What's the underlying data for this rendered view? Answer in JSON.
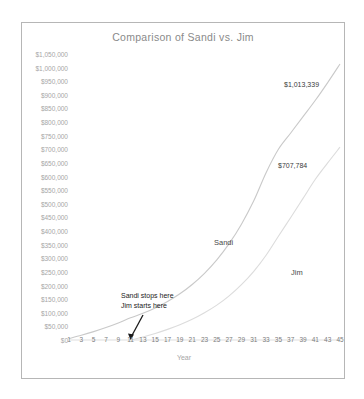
{
  "chart_data": {
    "type": "line",
    "title": "Comparison of Sandi vs. Jim",
    "xlabel": "Year",
    "ylabel": "",
    "grid": false,
    "legend_position": "inline-labels",
    "xlim": [
      1,
      45
    ],
    "ylim": [
      0,
      1050000
    ],
    "x_tick_labels": [
      "1",
      "3",
      "5",
      "7",
      "9",
      "11",
      "13",
      "15",
      "17",
      "19",
      "21",
      "23",
      "25",
      "27",
      "29",
      "31",
      "33",
      "35",
      "37",
      "39",
      "41",
      "43",
      "45"
    ],
    "y_tick_labels": [
      "$1,050,000",
      "$1,000,000",
      "$950,000",
      "$900,000",
      "$850,000",
      "$800,000",
      "$750,000",
      "$700,000",
      "$650,000",
      "$600,000",
      "$550,000",
      "$500,000",
      "$450,000",
      "$400,000",
      "$350,000",
      "$300,000",
      "$250,000",
      "$200,000",
      "$150,000",
      "$100,000",
      "$50,000",
      "$0"
    ],
    "y_tick_values": [
      1050000,
      1000000,
      950000,
      900000,
      850000,
      800000,
      750000,
      700000,
      650000,
      600000,
      550000,
      500000,
      450000,
      400000,
      350000,
      300000,
      250000,
      200000,
      150000,
      100000,
      50000,
      0
    ],
    "series": [
      {
        "name": "Sandi",
        "color": "#c9c9c9",
        "end_label": "$1,013,339",
        "end_value": 1013339,
        "x": [
          1,
          3,
          5,
          7,
          9,
          11,
          13,
          15,
          17,
          19,
          21,
          23,
          25,
          27,
          29,
          31,
          33,
          35,
          37,
          39,
          41,
          43,
          45
        ],
        "values": [
          5350,
          17300,
          30700,
          45700,
          62600,
          81400,
          97800,
          117500,
          141200,
          169700,
          203900,
          245000,
          294400,
          353800,
          425200,
          511000,
          614100,
          700000,
          760000,
          820000,
          880000,
          945000,
          1013339
        ]
      },
      {
        "name": "Jim",
        "color": "#dadada",
        "end_label": "$707,784",
        "end_value": 707784,
        "x": [
          11,
          13,
          15,
          17,
          19,
          21,
          23,
          25,
          27,
          29,
          31,
          33,
          35,
          37,
          39,
          41,
          43,
          45
        ],
        "values": [
          0,
          11000,
          24000,
          39000,
          56000,
          76000,
          100000,
          128000,
          162000,
          203000,
          252000,
          311000,
          381000,
          450000,
          520000,
          590000,
          650000,
          707784
        ]
      }
    ],
    "annotations": [
      {
        "name": "sandi-stops-jim-starts",
        "line1": "Sandi stops here",
        "line2": "Jim starts here",
        "arrow_target_year": 11
      }
    ]
  }
}
